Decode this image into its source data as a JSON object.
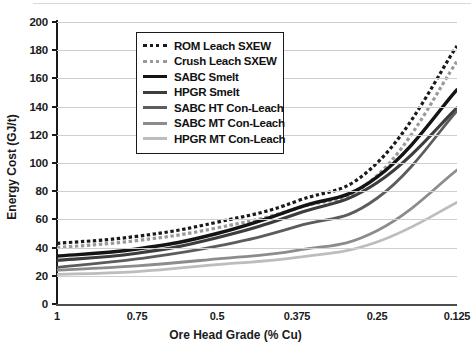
{
  "chart_data": {
    "type": "line",
    "title": "",
    "xlabel": "Ore Head Grade (% Cu)",
    "ylabel": "Energy Cost (GJ/t)",
    "categories": [
      "1",
      "0.75",
      "0.5",
      "0.375",
      "0.25",
      "0.125"
    ],
    "ylim": [
      0,
      200
    ],
    "ytick_values": [
      0,
      20,
      40,
      60,
      80,
      100,
      120,
      140,
      160,
      180,
      200
    ],
    "ytick_labels": [
      "0",
      "20",
      "40",
      "60",
      "80",
      "100",
      "120",
      "140",
      "160",
      "180",
      "200"
    ],
    "grid": true,
    "legend_position": "upper-center",
    "series": [
      {
        "name": "ROM Leach SXEW",
        "values": [
          43,
          48,
          58,
          73,
          100,
          183
        ],
        "color": "#1a1a1a",
        "style": "dotted",
        "width": 3.2
      },
      {
        "name": "Crush Leach SXEW",
        "values": [
          40,
          45,
          54,
          68,
          91,
          172
        ],
        "color": "#9a9a9a",
        "style": "dotted",
        "width": 3.2
      },
      {
        "name": "SABC Smelt",
        "values": [
          34,
          39,
          50,
          68,
          90,
          152
        ],
        "color": "#141414",
        "style": "solid",
        "width": 3.4
      },
      {
        "name": "HPGR Smelt",
        "values": [
          31,
          36,
          47,
          64,
          86,
          139
        ],
        "color": "#3d3d3d",
        "style": "solid",
        "width": 3.2
      },
      {
        "name": "SABC HT Con-Leach",
        "values": [
          26,
          32,
          41,
          55,
          75,
          137
        ],
        "color": "#5c5c5c",
        "style": "solid",
        "width": 2.8
      },
      {
        "name": "SABC MT Con-Leach",
        "values": [
          24,
          27,
          32,
          38,
          52,
          95
        ],
        "color": "#8c8c8c",
        "style": "solid",
        "width": 2.8
      },
      {
        "name": "HPGR MT Con-Leach",
        "values": [
          21,
          23,
          28,
          33,
          44,
          72
        ],
        "color": "#bdbdbd",
        "style": "solid",
        "width": 2.8
      }
    ]
  }
}
